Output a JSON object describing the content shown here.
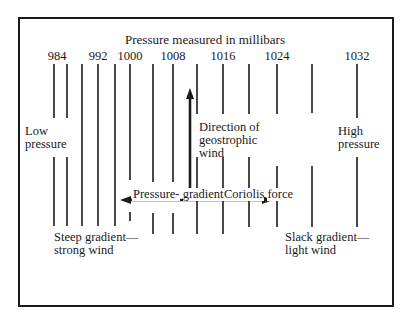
{
  "diagram": {
    "title": "Pressure measured in millibars",
    "isobar_labels": [
      {
        "text": "984",
        "x": 57
      },
      {
        "text": "992",
        "x": 98
      },
      {
        "text": "1000",
        "x": 130
      },
      {
        "text": "1008",
        "x": 173
      },
      {
        "text": "1016",
        "x": 223
      },
      {
        "text": "1024",
        "x": 277
      },
      {
        "text": "1032",
        "x": 357
      }
    ],
    "isobars": [
      {
        "x": 54,
        "segments": [
          [
            64,
            118
          ],
          [
            157,
            226
          ]
        ]
      },
      {
        "x": 67,
        "segments": [
          [
            64,
            118
          ],
          [
            157,
            226
          ]
        ]
      },
      {
        "x": 82,
        "segments": [
          [
            64,
            226
          ]
        ]
      },
      {
        "x": 98,
        "segments": [
          [
            64,
            226
          ]
        ]
      },
      {
        "x": 115,
        "segments": [
          [
            64,
            226
          ]
        ]
      },
      {
        "x": 130,
        "segments": [
          [
            64,
            180
          ],
          [
            212,
            221
          ]
        ]
      },
      {
        "x": 153,
        "segments": [
          [
            64,
            182
          ],
          [
            213,
            234
          ]
        ]
      },
      {
        "x": 173,
        "segments": [
          [
            64,
            182
          ],
          [
            213,
            234
          ]
        ]
      },
      {
        "x": 197,
        "segments": [
          [
            64,
            114
          ],
          [
            157,
            234
          ]
        ]
      },
      {
        "x": 223,
        "segments": [
          [
            64,
            114
          ],
          [
            157,
            234
          ]
        ]
      },
      {
        "x": 249,
        "segments": [
          [
            64,
            114
          ],
          [
            157,
            227
          ]
        ]
      },
      {
        "x": 277,
        "segments": [
          [
            64,
            114
          ],
          [
            166,
            227
          ]
        ]
      },
      {
        "x": 312,
        "segments": [
          [
            64,
            113
          ],
          [
            166,
            227
          ]
        ]
      },
      {
        "x": 357,
        "segments": [
          [
            64,
            118
          ],
          [
            157,
            227
          ]
        ]
      }
    ],
    "labels": {
      "low_pressure": [
        "Low",
        "pressure"
      ],
      "high_pressure": [
        "High",
        "pressure"
      ],
      "geostrophic": [
        "Direction of",
        "geostrophic",
        "wind"
      ],
      "pressure_gradient": [
        "Pressure-",
        "gradient force"
      ],
      "coriolis": [
        "Coriolis",
        "force"
      ],
      "steep": [
        "Steep gradient—",
        "strong wind"
      ],
      "slack": [
        "Slack gradient—",
        "light wind"
      ]
    },
    "arrows": {
      "geostrophic_wind": {
        "x": 190,
        "y_from": 200,
        "y_to": 88
      },
      "pressure_gradient_force": {
        "y": 200,
        "x_from": 190,
        "x_to": 120
      },
      "coriolis_force": {
        "y": 200,
        "x_from": 190,
        "x_to": 273
      }
    },
    "colors": {
      "ink": "#1a1a1a",
      "background": "#ffffff"
    }
  }
}
